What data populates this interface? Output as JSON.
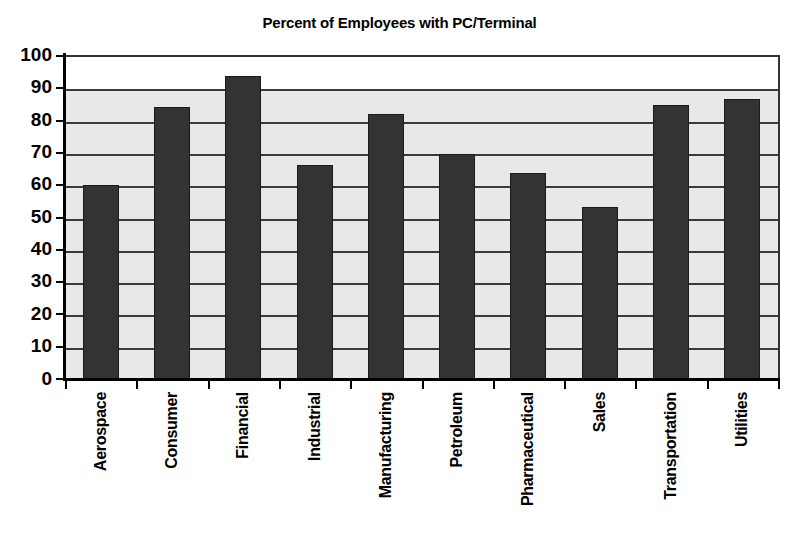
{
  "chart_data": {
    "type": "bar",
    "title": "Percent of Employees with PC/Terminal",
    "xlabel": "",
    "ylabel": "",
    "ylim": [
      0,
      100
    ],
    "ytick_step": 10,
    "yticks": [
      "100",
      "90",
      "80",
      "70",
      "60",
      "50",
      "40",
      "30",
      "20",
      "10",
      "0"
    ],
    "grid": "horizontal",
    "legend": "none",
    "bar_color": "#333333",
    "plot_background": "#e8e8e8",
    "categories": [
      "Aerospace",
      "Consumer",
      "Financial",
      "Industrial",
      "Manufacturing",
      "Petroleum",
      "Pharmaceutical",
      "Sales",
      "Transportation",
      "Utilities"
    ],
    "values": [
      60.5,
      84.5,
      94,
      66.5,
      82.5,
      70,
      64,
      53.5,
      85,
      87
    ]
  }
}
